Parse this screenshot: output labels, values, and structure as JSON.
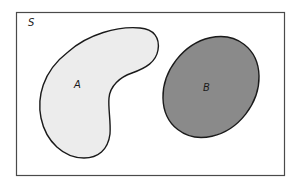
{
  "diagram": {
    "type": "venn",
    "universe": {
      "label": "S",
      "border_color": "#4a4a4a",
      "fill_color": "#ffffff"
    },
    "sets": [
      {
        "label": "A",
        "shape": "kidney",
        "fill_color": "#ececec",
        "stroke_color": "#1a1a1a"
      },
      {
        "label": "B",
        "shape": "ellipse",
        "fill_color": "#8a8a8a",
        "stroke_color": "#1a1a1a"
      }
    ],
    "relationship": "disjoint"
  }
}
